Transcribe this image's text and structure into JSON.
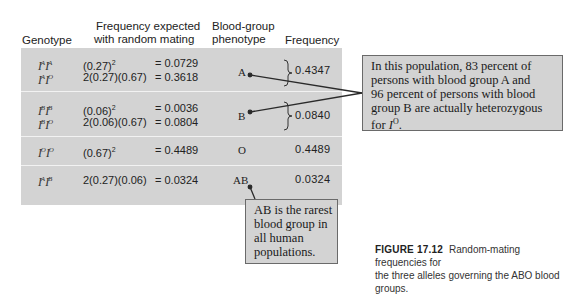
{
  "table": {
    "headers": {
      "genotype": "Genotype",
      "expected_line1": "Frequency expected",
      "expected_line2": "with random mating",
      "phenotype_line1": "Blood-group",
      "phenotype_line2": "phenotype",
      "frequency": "Frequency"
    },
    "rows": [
      {
        "genotypes": [
          {
            "a": "I",
            "a_sup": "A",
            "b": "I",
            "b_sup": "A"
          },
          {
            "a": "I",
            "a_sup": "A",
            "b": "I",
            "b_sup": "O"
          }
        ],
        "calcs": [
          {
            "expr": "(0.27)",
            "exp": "2",
            "result": "= 0.0729"
          },
          {
            "expr": "2(0.27)(0.67)",
            "exp": "",
            "result": "= 0.3618"
          }
        ],
        "phenotype": "A",
        "frequency": "0.4347"
      },
      {
        "genotypes": [
          {
            "a": "I",
            "a_sup": "B",
            "b": "I",
            "b_sup": "B"
          },
          {
            "a": "I",
            "a_sup": "B",
            "b": "I",
            "b_sup": "O"
          }
        ],
        "calcs": [
          {
            "expr": "(0.06)",
            "exp": "2",
            "result": "= 0.0036"
          },
          {
            "expr": "2(0.06)(0.67)",
            "exp": "",
            "result": "= 0.0804"
          }
        ],
        "phenotype": "B",
        "frequency": "0.0840"
      },
      {
        "genotypes": [
          {
            "a": "I",
            "a_sup": "O",
            "b": "I",
            "b_sup": "O"
          }
        ],
        "calcs": [
          {
            "expr": "(0.67)",
            "exp": "2",
            "result": "= 0.4489"
          }
        ],
        "phenotype": "O",
        "frequency": "0.4489"
      },
      {
        "genotypes": [
          {
            "a": "I",
            "a_sup": "A",
            "b": "I",
            "b_sup": "B"
          }
        ],
        "calcs": [
          {
            "expr": "2(0.27)(0.06)",
            "exp": "",
            "result": "= 0.0324"
          }
        ],
        "phenotype": "AB",
        "frequency": "0.0324"
      }
    ]
  },
  "callouts": {
    "heterozygous": {
      "lines": [
        "In this population, 83 percent of",
        "persons with blood group A and",
        "96 percent of persons with blood",
        "group B are actually heterozygous"
      ],
      "last_prefix": "for ",
      "last_allele": "I",
      "last_allele_sup": "O",
      "last_suffix": "."
    },
    "rarest": {
      "lines": [
        "AB is the rarest",
        "blood group in",
        "all human",
        "populations."
      ]
    }
  },
  "caption": {
    "figure_label": "FIGURE 17.12",
    "line1": "Random-mating frequencies for",
    "line2": "the three alleles governing the ABO blood groups."
  },
  "colors": {
    "table_bg": "#d3d3d3",
    "divider": "#f2f2f2",
    "callout_border": "#6a6a6a",
    "leader_line": "#2a2a2a"
  }
}
